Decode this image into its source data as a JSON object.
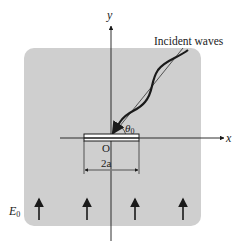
{
  "diagram": {
    "axes": {
      "x_label": "x",
      "y_label": "y",
      "origin_label": "O"
    },
    "incident_label": "Incident waves",
    "angle_label": "θ",
    "angle_subscript": "0",
    "width_label": "2a",
    "field_label": "E",
    "field_subscript": "0",
    "field_arrow_count": 4,
    "colors": {
      "region": "#cfcfcf",
      "ink": "#1a1a1a",
      "strip_fill": "#ffffff"
    }
  }
}
